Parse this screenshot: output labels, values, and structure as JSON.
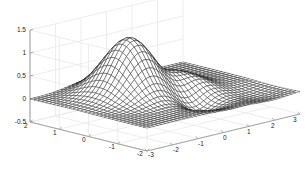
{
  "figure": {
    "kind": "matlab-mesh-plot",
    "background": "#ffffff",
    "mesh_color": "#1a1a1a",
    "face_color": "#ffffff",
    "grid_color": "#e8e8e8",
    "axis_color": "#9a9a9a",
    "tick_text_color": "#222222"
  },
  "chart_data": {
    "type": "line",
    "render": "3d-mesh-surface",
    "title": "",
    "xlabel": "",
    "ylabel": "",
    "zlabel": "",
    "grid": true,
    "legend": null,
    "view": {
      "azimuth": -37.5,
      "elevation": 30
    },
    "xlim": [
      -3,
      3
    ],
    "ylim": [
      -2,
      2
    ],
    "zlim": [
      -0.5,
      1.5
    ],
    "xticks": [
      -3,
      -2,
      -1,
      0,
      1,
      2,
      3
    ],
    "xticklabels": [
      "-3",
      "-2",
      "-1",
      "0",
      "1",
      "2",
      "3"
    ],
    "yticks": [
      2,
      1,
      0,
      -1,
      -2
    ],
    "yticklabels": [
      "2",
      "1",
      "0",
      "-1",
      "-2"
    ],
    "zticks": [
      -0.5,
      0,
      0.5,
      1,
      1.5
    ],
    "zticklabels": [
      "-0.5",
      "0",
      "0.5",
      "1",
      "1.5"
    ],
    "mesh_nx": 41,
    "mesh_ny": 31,
    "surface_description": "peaks-like surface: tall positive lobe near (x=-0.6,y=0.6) reaching z~1.25, shallow negative trough near (x=0.3,y=-0.6) about z~-0.3, secondary low ridge near x=1, decaying to z~0 toward x=3",
    "z_max": 1.25,
    "z_min": -0.35
  },
  "zticks": [
    {
      "label": "1.5",
      "y": 30
    },
    {
      "label": "1",
      "y": 53
    },
    {
      "label": "0.5",
      "y": 76
    },
    {
      "label": "0",
      "y": 99
    },
    {
      "label": "-0.5",
      "y": 122
    }
  ],
  "yticks": [
    {
      "label": "2",
      "x": 28,
      "y": 126
    },
    {
      "label": "1",
      "x": 57,
      "y": 133
    },
    {
      "label": "0",
      "x": 86,
      "y": 140
    },
    {
      "label": "-1",
      "x": 113,
      "y": 147
    },
    {
      "label": "-2",
      "x": 141,
      "y": 154
    }
  ],
  "xticks": [
    {
      "label": "-3",
      "x": 152,
      "y": 155
    },
    {
      "label": "-2",
      "x": 177,
      "y": 150
    },
    {
      "label": "-1",
      "x": 202,
      "y": 144
    },
    {
      "label": "0",
      "x": 227,
      "y": 138
    },
    {
      "label": "1",
      "x": 251,
      "y": 132
    },
    {
      "label": "2",
      "x": 275,
      "y": 126
    },
    {
      "label": "3",
      "x": 297,
      "y": 120
    }
  ]
}
